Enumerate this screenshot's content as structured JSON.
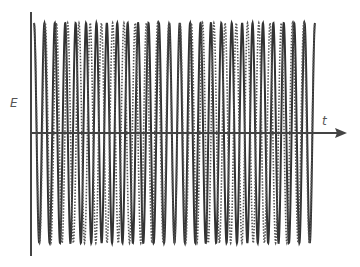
{
  "chart_data": {
    "type": "line",
    "title": "",
    "xlabel": "t",
    "ylabel": "E",
    "grid": false,
    "legend": null,
    "series": [
      {
        "name": "wave 1",
        "style": "solid",
        "amplitude": 1,
        "cycles": 27
      },
      {
        "name": "wave 2",
        "style": "dashed",
        "amplitude": 1,
        "cycles": 25
      }
    ],
    "x_range": [
      0,
      1
    ],
    "ylim": [
      -1,
      1
    ]
  },
  "axes": {
    "x_label": "t",
    "y_label": "E"
  },
  "colors": {
    "solid": "#333333",
    "dashed": "#555555",
    "axis": "#444444"
  }
}
